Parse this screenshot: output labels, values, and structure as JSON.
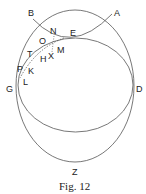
{
  "caption": "Fig. 12",
  "labels": {
    "A": "A",
    "B": "B",
    "D": "D",
    "E": "E",
    "G": "G",
    "H": "H",
    "K": "K",
    "L": "L",
    "M": "M",
    "N": "N",
    "O": "O",
    "P": "P",
    "T": "T",
    "X": "X",
    "Z": "Z"
  },
  "colors": {
    "line": "#555555",
    "text": "#222222"
  }
}
